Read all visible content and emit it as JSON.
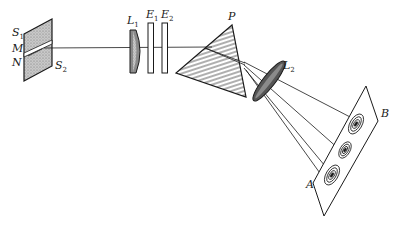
{
  "diagram": {
    "labels": {
      "S1": {
        "base": "S",
        "sub": "1"
      },
      "M": {
        "base": "M",
        "sub": ""
      },
      "N": {
        "base": "N",
        "sub": ""
      },
      "S2": {
        "base": "S",
        "sub": "2"
      },
      "L1": {
        "base": "L",
        "sub": "1"
      },
      "E1": {
        "base": "E",
        "sub": "1"
      },
      "E2": {
        "base": "E",
        "sub": "2"
      },
      "P": {
        "base": "P",
        "sub": ""
      },
      "L2": {
        "base": "L",
        "sub": "2"
      },
      "A": {
        "base": "A",
        "sub": ""
      },
      "B": {
        "base": "B",
        "sub": ""
      }
    },
    "components": [
      {
        "id": "slit-plate",
        "description": "Slit plate with two slit halves S1/S2 separated at MN"
      },
      {
        "id": "lens-L1",
        "description": "Collimating lens L1"
      },
      {
        "id": "etalon-E1",
        "description": "Etalon plate E1"
      },
      {
        "id": "etalon-E2",
        "description": "Etalon plate E2"
      },
      {
        "id": "prism-P",
        "description": "Dispersing prism P"
      },
      {
        "id": "lens-L2",
        "description": "Focusing lens L2"
      },
      {
        "id": "screen-AB",
        "description": "Photographic plate AB showing ring patterns"
      }
    ],
    "ring_patterns": 3,
    "colors": {
      "ink": "#1a1a1a",
      "background": "#ffffff",
      "shade": "#9a9a9a",
      "dark_shade": "#555555"
    }
  }
}
